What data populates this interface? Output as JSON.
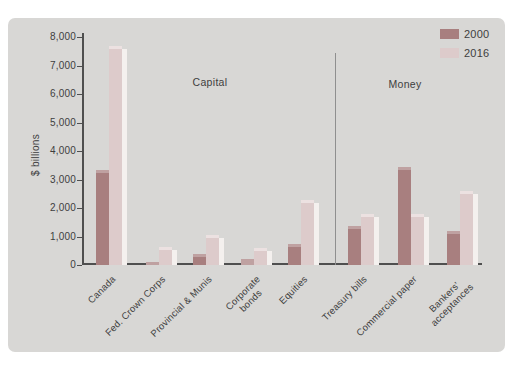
{
  "figure": {
    "background": "#ffffff",
    "panel_bg": "#d8d7d5",
    "axis_color": "#4f4f4f",
    "text_color": "#3e3e3e",
    "divider_color": "#8f8f8f"
  },
  "chart_data": {
    "type": "bar",
    "title": "",
    "xlabel": "",
    "ylabel": "$ billions",
    "ylim": [
      0,
      8000
    ],
    "ytick_interval": 1000,
    "ytick_labels": [
      "0",
      "1,000",
      "2,000",
      "3,000",
      "4,000",
      "5,000",
      "6,000",
      "7,000",
      "8,000"
    ],
    "grid": false,
    "legend_position": "top-right",
    "categories": [
      {
        "lines": [
          "Canada"
        ]
      },
      {
        "lines": [
          "Fed. Crown Corps"
        ]
      },
      {
        "lines": [
          "Provincial & Munis"
        ]
      },
      {
        "lines": [
          "Corporate",
          "bonds"
        ]
      },
      {
        "lines": [
          "Equities"
        ]
      },
      {
        "lines": [
          "Treasury bills"
        ]
      },
      {
        "lines": [
          "Commercial paper"
        ]
      },
      {
        "lines": [
          "Bankers'",
          "acceptances"
        ]
      }
    ],
    "series": [
      {
        "name": "2000",
        "color": "#a87f7f",
        "cap_color": "#bfa1a1",
        "values": [
          3350,
          100,
          380,
          200,
          730,
          1380,
          3450,
          1200
        ]
      },
      {
        "name": "2016",
        "color": "#ddcbcb",
        "cap_color": "#ece1e1",
        "side_color": "#f4f0ee",
        "values": [
          7700,
          620,
          1050,
          600,
          2280,
          1800,
          1780,
          2600
        ]
      }
    ],
    "sections": [
      {
        "label": "Capital",
        "category_range": [
          0,
          4
        ]
      },
      {
        "label": "Money",
        "category_range": [
          5,
          7
        ]
      }
    ]
  }
}
